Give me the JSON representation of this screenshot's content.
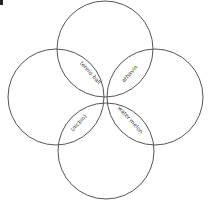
{
  "diagram": {
    "type": "venn-four-circles",
    "stroke_color": "#555555",
    "background": "#ffffff",
    "circles": [
      {
        "id": "top",
        "cx": 105,
        "cy": 49,
        "r": 48
      },
      {
        "id": "left",
        "cx": 56,
        "cy": 97,
        "r": 48
      },
      {
        "id": "right",
        "cx": 155,
        "cy": 97,
        "r": 48
      },
      {
        "id": "bottom",
        "cx": 106,
        "cy": 151,
        "r": 48
      }
    ],
    "labels": [
      {
        "id": "top-left",
        "text": "tennis ball",
        "x": 89,
        "y": 74,
        "rotate": 48
      },
      {
        "id": "top-right",
        "text": "athavin",
        "x": 131,
        "y": 75,
        "rotate": -48
      },
      {
        "id": "bottom-right",
        "text": "water melon",
        "x": 129,
        "y": 121,
        "rotate": 48
      },
      {
        "id": "bottom-left",
        "text": "(nicbio)",
        "x": 80,
        "y": 124,
        "rotate": -48
      }
    ]
  }
}
